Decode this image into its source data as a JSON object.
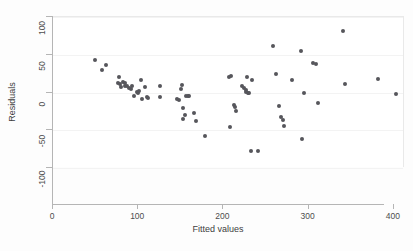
{
  "chart_data": {
    "type": "scatter",
    "title": "",
    "xlabel": "Fitted values",
    "ylabel": "Residuals",
    "xlim": [
      0,
      413
    ],
    "ylim": [
      -100,
      100
    ],
    "xticks": [
      0,
      100,
      200,
      300,
      400
    ],
    "yticks": [
      -100,
      -50,
      0,
      50,
      100
    ],
    "xtick_labels": [
      "0",
      "100",
      "200",
      "300",
      "400"
    ],
    "ytick_labels": [
      "-100",
      "-50",
      "0",
      "50",
      "100"
    ],
    "grid": "horizontal-faint",
    "legend": null,
    "marker_color": "#56565b",
    "marker_size": 4,
    "series": [
      {
        "name": "residuals",
        "points": [
          [
            49,
            43
          ],
          [
            57,
            30
          ],
          [
            62,
            37
          ],
          [
            78,
            20
          ],
          [
            76,
            13
          ],
          [
            79,
            11
          ],
          [
            80,
            7
          ],
          [
            82,
            14
          ],
          [
            84,
            12
          ],
          [
            85,
            9
          ],
          [
            87,
            8
          ],
          [
            89,
            6
          ],
          [
            91,
            4
          ],
          [
            93,
            9
          ],
          [
            95,
            -5
          ],
          [
            98,
            1
          ],
          [
            100,
            0
          ],
          [
            101,
            2
          ],
          [
            103,
            17
          ],
          [
            105,
            -9
          ],
          [
            108,
            7
          ],
          [
            110,
            -6
          ],
          [
            112,
            -7
          ],
          [
            125,
            8
          ],
          [
            126,
            -6
          ],
          [
            146,
            -8
          ],
          [
            148,
            -10
          ],
          [
            150,
            4
          ],
          [
            151,
            10
          ],
          [
            152,
            -21
          ],
          [
            153,
            -35
          ],
          [
            155,
            -30
          ],
          [
            156,
            -5
          ],
          [
            158,
            -4
          ],
          [
            160,
            -5
          ],
          [
            165,
            -27
          ],
          [
            168,
            -38
          ],
          [
            178,
            -57
          ],
          [
            207,
            21
          ],
          [
            209,
            22
          ],
          [
            208,
            -46
          ],
          [
            212,
            -17
          ],
          [
            214,
            -19
          ],
          [
            215,
            -24
          ],
          [
            222,
            8
          ],
          [
            224,
            6
          ],
          [
            226,
            3
          ],
          [
            227,
            1
          ],
          [
            229,
            0
          ],
          [
            230,
            -1
          ],
          [
            228,
            20
          ],
          [
            234,
            16
          ],
          [
            232,
            -77
          ],
          [
            240,
            -78
          ],
          [
            258,
            61
          ],
          [
            262,
            25
          ],
          [
            265,
            -18
          ],
          [
            268,
            -33
          ],
          [
            270,
            -36
          ],
          [
            271,
            -45
          ],
          [
            280,
            16
          ],
          [
            291,
            55
          ],
          [
            292,
            -62
          ],
          [
            295,
            0
          ],
          [
            305,
            39
          ],
          [
            308,
            38
          ],
          [
            311,
            -14
          ],
          [
            340,
            82
          ],
          [
            343,
            11
          ],
          [
            381,
            18
          ],
          [
            402,
            -2
          ]
        ]
      }
    ]
  }
}
